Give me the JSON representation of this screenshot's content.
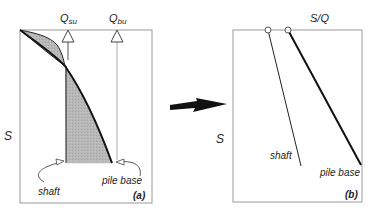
{
  "panel_a": {
    "tag": "(a)",
    "y_axis_label": "S",
    "load_labels": {
      "shaft": "Q",
      "shaft_sub": "su",
      "base": "Q",
      "base_sub": "bu"
    },
    "curve_labels": {
      "shaft": "shaft",
      "base": "pile base"
    }
  },
  "panel_b": {
    "tag": "(b)",
    "x_axis_label": "S/Q",
    "y_axis_label": "S",
    "line_labels": {
      "shaft": "shaft",
      "base": "pile base"
    }
  },
  "colors": {
    "fill": "#b5b5b5",
    "frame": "#9a9a9a",
    "line": "#111111"
  }
}
